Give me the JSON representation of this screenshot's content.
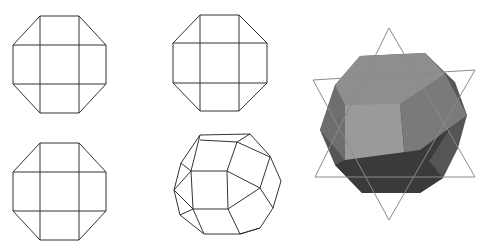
{
  "figure": {
    "views": [
      {
        "id": "front-view",
        "type": "octagon-projection"
      },
      {
        "id": "side-view",
        "type": "octagon-projection"
      },
      {
        "id": "top-view",
        "type": "octagon-projection"
      },
      {
        "id": "perspective-wireframe",
        "type": "wireframe"
      },
      {
        "id": "shaded-render",
        "type": "shaded-3d-with-hexagram"
      }
    ],
    "colors": {
      "line": "#333333",
      "shade_light": "#9a9a9a",
      "shade_mid": "#6e6e6e",
      "shade_dark": "#3c3c3c",
      "star_line": "#8a8a8a"
    }
  }
}
